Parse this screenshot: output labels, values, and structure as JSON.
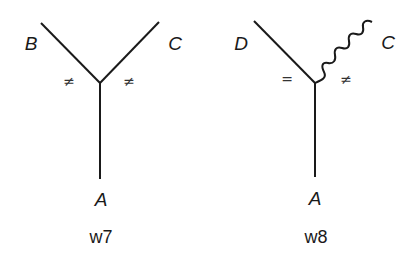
{
  "diagrams": [
    {
      "id": "w7",
      "caption": "w7",
      "labels": {
        "upper_left": "B",
        "upper_right": "C",
        "bottom": "A"
      },
      "marks": {
        "left": "≠",
        "right": "≠"
      },
      "edges": [
        {
          "from": "junction",
          "to": "B",
          "style": "straight"
        },
        {
          "from": "junction",
          "to": "C",
          "style": "straight"
        },
        {
          "from": "junction",
          "to": "A",
          "style": "straight"
        }
      ]
    },
    {
      "id": "w8",
      "caption": "w8",
      "labels": {
        "upper_left": "D",
        "upper_right": "C",
        "bottom": "A"
      },
      "marks": {
        "left": "=",
        "right": "≠"
      },
      "edges": [
        {
          "from": "junction",
          "to": "D",
          "style": "straight"
        },
        {
          "from": "junction",
          "to": "C",
          "style": "wavy"
        },
        {
          "from": "junction",
          "to": "A",
          "style": "straight"
        }
      ]
    }
  ],
  "colors": {
    "stroke": "#1a1a1a",
    "background": "#ffffff"
  }
}
